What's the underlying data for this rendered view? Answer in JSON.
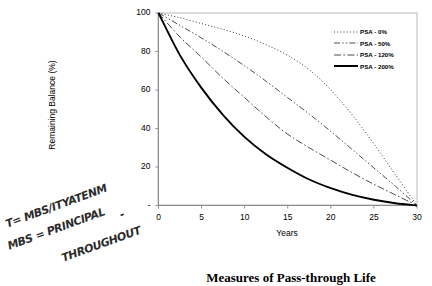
{
  "caption": "Measures of Pass-through Life",
  "handwriting": {
    "line1": "T= MBS/ITYATENM",
    "line2": "MBS = PRINCIPAL",
    "line3": "THROUGHOUT",
    "dash": "-"
  },
  "chart_data": {
    "type": "line",
    "title": "",
    "xlabel": "Years",
    "ylabel": "Remaining Balance (%)",
    "xlim": [
      0,
      30
    ],
    "ylim": [
      0,
      100
    ],
    "xticks": [
      "0",
      "5",
      "10",
      "15",
      "20",
      "25",
      "30"
    ],
    "yticks": [
      "-",
      "20",
      "40",
      "60",
      "80",
      "100"
    ],
    "grid": false,
    "legend_position": "top-right",
    "x": [
      0,
      2.5,
      5,
      7.5,
      10,
      12.5,
      15,
      17.5,
      20,
      22.5,
      25,
      27.5,
      30
    ],
    "series": [
      {
        "name": "PSA - 0%",
        "style": "dotted",
        "color": "#3a3a3a",
        "values": [
          100,
          97.5,
          94.5,
          91.5,
          88,
          83.5,
          78,
          70.5,
          60,
          47,
          32,
          16,
          0
        ]
      },
      {
        "name": "PSA - 50%",
        "style": "dash-dot-dot",
        "color": "#4a4a4a",
        "values": [
          100,
          93.5,
          87,
          80,
          72.5,
          64.5,
          56,
          47.5,
          38.5,
          29,
          19.5,
          10,
          0
        ]
      },
      {
        "name": "PSA - 120%",
        "style": "dash-dot",
        "color": "#4a4a4a",
        "values": [
          100,
          87.5,
          77,
          66,
          56,
          46,
          37,
          30,
          23.5,
          17,
          11,
          5.5,
          0
        ]
      },
      {
        "name": "PSA - 200%",
        "style": "solid",
        "color": "#000000",
        "values": [
          100,
          78,
          61,
          47,
          35.5,
          26.5,
          19.5,
          13.5,
          9,
          5.5,
          3,
          1.2,
          0
        ]
      }
    ]
  }
}
